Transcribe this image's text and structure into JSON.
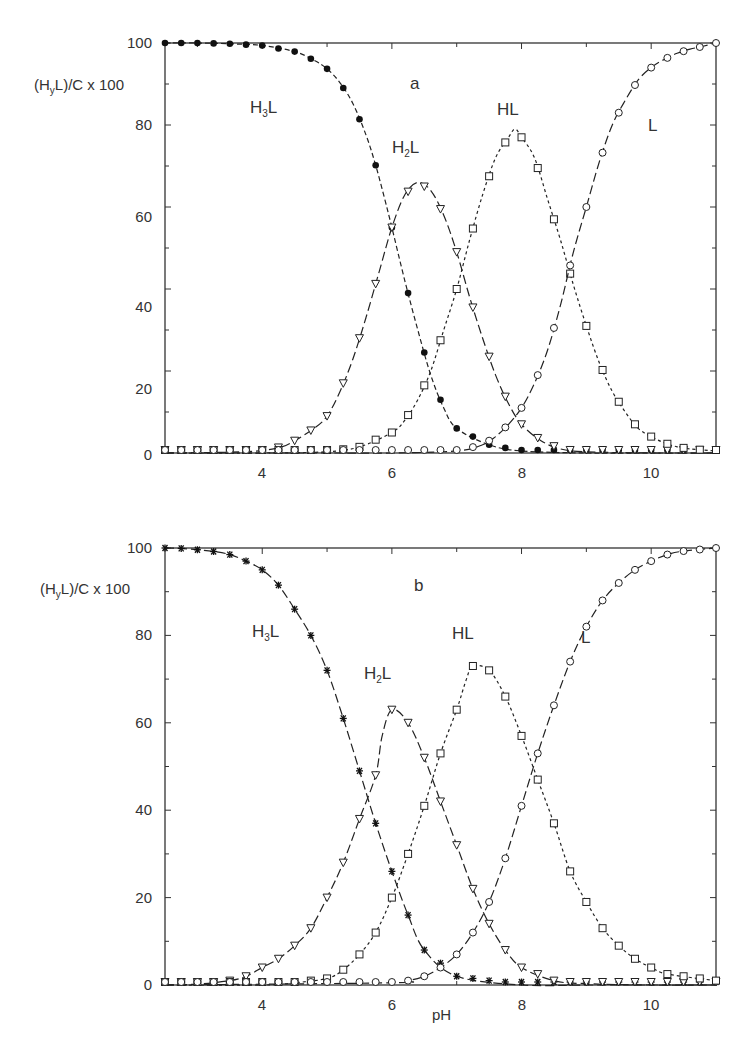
{
  "figure": {
    "x_axis_label": "pH",
    "y_axis_label_parts": {
      "pre": "(H",
      "sub": "y",
      "post": "L)/C x 100"
    },
    "y_ticks": [
      "0",
      "20",
      "40",
      "60",
      "80",
      "100"
    ],
    "x_ticks": [
      "4",
      "6",
      "8",
      "10"
    ]
  },
  "panels": [
    {
      "tag": "a",
      "species_labels": {
        "H3L": {
          "main": "H",
          "sub": "3",
          "tail": "L"
        },
        "H2L": {
          "main": "H",
          "sub": "2",
          "tail": "L"
        },
        "HL": "HL",
        "L": "L"
      }
    },
    {
      "tag": "b",
      "species_labels": {
        "H3L": {
          "main": "H",
          "sub": "3",
          "tail": "L"
        },
        "H2L": {
          "main": "H",
          "sub": "2",
          "tail": "L"
        },
        "HL": "HL",
        "L": "L"
      }
    }
  ],
  "chart_data": [
    {
      "type": "line",
      "title": "a",
      "xlabel": "pH",
      "ylabel": "(HyL)/C x 100",
      "xlim": [
        2.5,
        11
      ],
      "ylim": [
        0,
        100
      ],
      "x_ticks": [
        4,
        6,
        8,
        10
      ],
      "y_ticks": [
        0,
        20,
        40,
        60,
        80,
        100
      ],
      "grid": false,
      "legend": "inline species labels (H3L, H2L, HL, L)",
      "pKa": [
        5.75,
        7.0,
        8.8
      ],
      "series": [
        {
          "name": "H3L",
          "marker": "filled-circle",
          "line": "dashed",
          "x": [
            2.5,
            3.0,
            3.5,
            4.0,
            4.5,
            4.8,
            5.0,
            5.2,
            5.4,
            5.6,
            5.75,
            5.9,
            6.0,
            6.2,
            6.4,
            6.6,
            6.8,
            7.0,
            7.5,
            8.0,
            9.0,
            10.0,
            11.0
          ],
          "y": [
            100,
            100,
            99.8,
            99.4,
            97.9,
            95.8,
            93.7,
            90.3,
            85.2,
            77.6,
            70.2,
            61.3,
            55,
            42,
            30,
            19,
            11,
            6,
            2,
            0.5,
            0,
            0,
            0
          ]
        },
        {
          "name": "H2L",
          "marker": "open-triangle-down",
          "line": "long-dash",
          "x": [
            2.5,
            3.5,
            4.0,
            4.3,
            4.5,
            4.8,
            5.0,
            5.2,
            5.4,
            5.6,
            5.8,
            6.0,
            6.2,
            6.4,
            6.6,
            6.8,
            7.0,
            7.2,
            7.4,
            7.6,
            7.8,
            8.0,
            8.3,
            8.6,
            9.0,
            10.0,
            11.0
          ],
          "y": [
            0,
            0.2,
            0.6,
            1.5,
            3,
            6,
            9,
            15,
            23,
            33,
            44,
            55,
            63,
            66,
            64,
            58,
            49,
            38,
            28,
            19,
            12,
            7,
            3,
            1,
            0.3,
            0,
            0
          ]
        },
        {
          "name": "HL",
          "marker": "open-square",
          "line": "short-dash",
          "x": [
            2.5,
            4.0,
            5.0,
            5.5,
            6.0,
            6.2,
            6.4,
            6.6,
            6.8,
            7.0,
            7.2,
            7.4,
            7.6,
            7.8,
            7.9,
            8.0,
            8.2,
            8.4,
            8.6,
            8.8,
            9.0,
            9.2,
            9.4,
            9.6,
            9.8,
            10.0,
            10.2,
            10.4,
            10.6,
            11.0
          ],
          "y": [
            0,
            0,
            0.3,
            1.5,
            5,
            8,
            13,
            20,
            30,
            40,
            52,
            63,
            72,
            77,
            79,
            77,
            72,
            62,
            52,
            41,
            31,
            22,
            15,
            10,
            6,
            4,
            2.5,
            1.5,
            1,
            0.5
          ]
        },
        {
          "name": "L",
          "marker": "open-circle",
          "line": "long-dash",
          "x": [
            2.5,
            5.0,
            6.0,
            7.0,
            7.4,
            7.6,
            7.8,
            8.0,
            8.2,
            8.4,
            8.6,
            8.8,
            9.0,
            9.2,
            9.4,
            9.6,
            9.8,
            10.0,
            10.2,
            10.4,
            10.6,
            10.8,
            11.0
          ],
          "y": [
            0,
            0,
            0,
            0.5,
            2,
            4,
            7,
            11,
            17,
            25,
            36,
            49,
            60,
            71,
            80,
            86,
            91,
            94,
            96,
            97.5,
            98.5,
            99.2,
            100
          ]
        }
      ]
    },
    {
      "type": "line",
      "title": "b",
      "xlabel": "pH",
      "ylabel": "(HyL)/C x 100",
      "xlim": [
        2.5,
        11
      ],
      "ylim": [
        0,
        100
      ],
      "x_ticks": [
        4,
        6,
        8,
        10
      ],
      "y_ticks": [
        0,
        20,
        40,
        60,
        80,
        100
      ],
      "grid": false,
      "legend": "inline species labels (H3L, H2L, HL, L)",
      "pKa": [
        5.3,
        6.3,
        7.9
      ],
      "series": [
        {
          "name": "H3L",
          "marker": "asterisk",
          "line": "long-dash",
          "x": [
            2.5,
            2.75,
            3.0,
            3.25,
            3.5,
            3.75,
            4.0,
            4.25,
            4.5,
            4.75,
            5.0,
            5.25,
            5.5,
            5.75,
            6.0,
            6.25,
            6.5,
            7.0,
            8.0,
            9.0,
            10.0,
            11.0
          ],
          "y": [
            100,
            99.9,
            99.6,
            99.2,
            98.5,
            97,
            95,
            91.5,
            86,
            80,
            72,
            61,
            49,
            37,
            26,
            16,
            8,
            2,
            0,
            0,
            0,
            0
          ]
        },
        {
          "name": "H2L",
          "marker": "open-triangle-down",
          "line": "long-dash",
          "x": [
            2.5,
            3.0,
            3.5,
            3.75,
            4.0,
            4.25,
            4.5,
            4.75,
            5.0,
            5.25,
            5.5,
            5.75,
            5.85,
            6.0,
            6.25,
            6.5,
            6.75,
            7.0,
            7.25,
            7.5,
            7.75,
            8.0,
            8.5,
            9.0,
            10.0,
            11.0
          ],
          "y": [
            0,
            0.2,
            1,
            2,
            4,
            6,
            9,
            13,
            20,
            28,
            38,
            48,
            57,
            63,
            60,
            52,
            42,
            32,
            22,
            14,
            8,
            4,
            1,
            0.3,
            0,
            0
          ]
        },
        {
          "name": "HL",
          "marker": "open-square",
          "line": "short-dash",
          "x": [
            2.5,
            4.0,
            4.5,
            5.0,
            5.25,
            5.5,
            5.75,
            6.0,
            6.25,
            6.5,
            6.75,
            7.0,
            7.15,
            7.25,
            7.5,
            7.75,
            8.0,
            8.25,
            8.5,
            8.75,
            9.0,
            9.25,
            9.5,
            9.75,
            10.0,
            10.25,
            11.0
          ],
          "y": [
            0,
            0,
            0.5,
            1.5,
            3.5,
            7,
            12,
            20,
            30,
            41,
            53,
            63,
            70,
            73,
            72,
            66,
            57,
            47,
            37,
            26,
            19,
            13,
            9,
            6,
            4,
            2.5,
            1
          ]
        },
        {
          "name": "L",
          "marker": "open-circle",
          "line": "long-dash",
          "x": [
            2.5,
            6.0,
            6.25,
            6.5,
            6.75,
            7.0,
            7.25,
            7.5,
            7.75,
            8.0,
            8.25,
            8.5,
            8.75,
            9.0,
            9.25,
            9.5,
            9.75,
            10.0,
            10.25,
            10.5,
            11.0
          ],
          "y": [
            0,
            0.5,
            1,
            2,
            4,
            7,
            12,
            19,
            29,
            41,
            53,
            64,
            74,
            82,
            88,
            92,
            95,
            97,
            98.5,
            99.3,
            100
          ]
        }
      ]
    }
  ]
}
